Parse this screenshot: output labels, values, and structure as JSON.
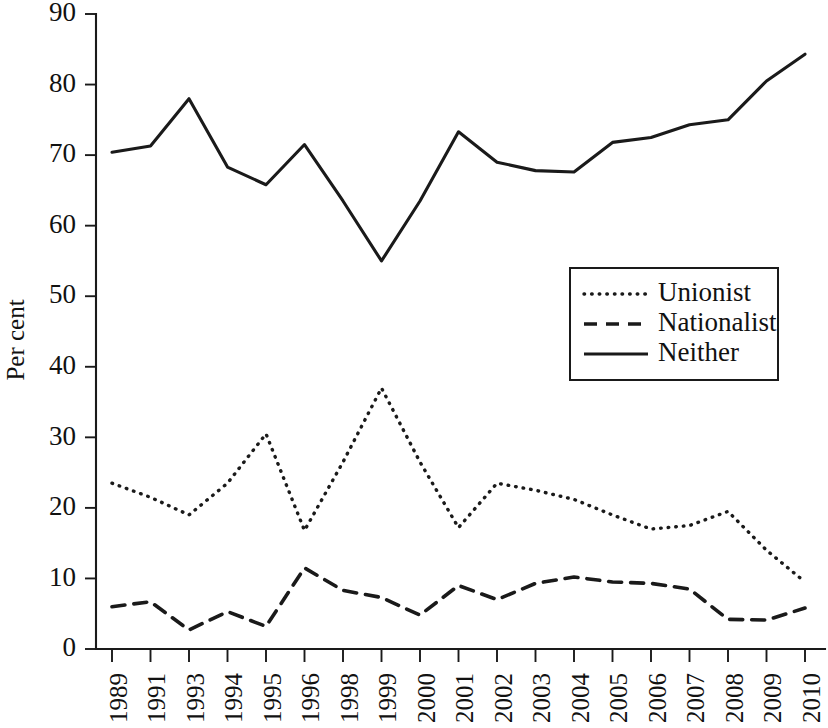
{
  "chart_data": {
    "type": "line",
    "title": "",
    "xlabel": "",
    "ylabel": "Per cent",
    "ylim": [
      0,
      90
    ],
    "yticks": [
      0,
      10,
      20,
      30,
      40,
      50,
      60,
      70,
      80,
      90
    ],
    "grid": false,
    "legend_position": "center-right",
    "categories": [
      "1989",
      "1991",
      "1993",
      "1994",
      "1995",
      "1996",
      "1998",
      "1999",
      "2000",
      "2001",
      "2002",
      "2003",
      "2004",
      "2005",
      "2006",
      "2007",
      "2008",
      "2009",
      "2010"
    ],
    "series": [
      {
        "name": "Unionist",
        "style": "dotted",
        "color": "#1a1a1a",
        "values": [
          23.5,
          21.5,
          19.0,
          23.5,
          30.5,
          16.8,
          26.5,
          37.0,
          26.5,
          17.2,
          23.5,
          22.5,
          21.2,
          19.0,
          17.0,
          17.5,
          19.5,
          14.0,
          9.5
        ]
      },
      {
        "name": "Nationalist",
        "style": "dashed",
        "color": "#1a1a1a",
        "values": [
          6.0,
          6.7,
          2.7,
          5.3,
          3.2,
          11.5,
          8.3,
          7.3,
          4.8,
          9.0,
          7.0,
          9.3,
          10.2,
          9.5,
          9.3,
          8.5,
          4.2,
          4.1,
          5.8
        ]
      },
      {
        "name": "Neither",
        "style": "solid",
        "color": "#1a1a1a",
        "values": [
          70.4,
          71.3,
          78.0,
          68.3,
          65.8,
          71.5,
          63.5,
          55.0,
          63.5,
          73.3,
          69.0,
          67.8,
          67.6,
          71.8,
          72.5,
          74.3,
          75.0,
          80.5,
          84.3
        ]
      }
    ],
    "legend": [
      {
        "label": "Unionist",
        "style": "dotted"
      },
      {
        "label": "Nationalist",
        "style": "dashed"
      },
      {
        "label": "Neither",
        "style": "solid"
      }
    ]
  }
}
